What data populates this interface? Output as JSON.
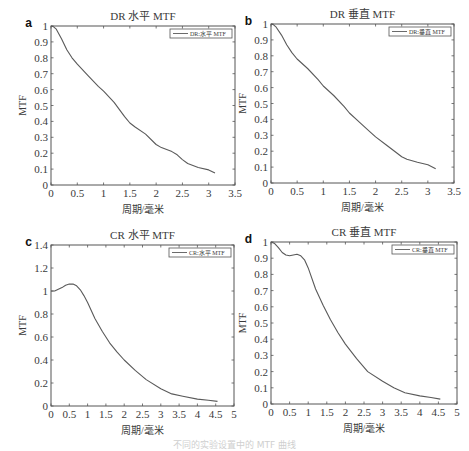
{
  "figure": {
    "axis_color": "#555555",
    "line_color": "#5a5a5a",
    "text_color": "#3a3a3a",
    "caption": "不同的实验设置中的 MTF 曲线"
  },
  "chart_data": [
    {
      "panel": "a",
      "type": "line",
      "title": "DR 水平 MTF",
      "xlabel": "周期/毫米",
      "ylabel": "MTF",
      "legend": "DR:水平 MTF",
      "legend_position": "top-right",
      "grid": false,
      "xlim": [
        0,
        3.5
      ],
      "ylim": [
        0,
        1
      ],
      "xticks": [
        0,
        0.5,
        1,
        1.5,
        2,
        2.5,
        3,
        3.5
      ],
      "xtick_labels": [
        "0",
        "0.5",
        "1",
        "1.5",
        "2",
        "2.5",
        "3",
        "3.5"
      ],
      "yticks": [
        0,
        0.1,
        0.2,
        0.3,
        0.4,
        0.5,
        0.6,
        0.7,
        0.8,
        0.9,
        1
      ],
      "ytick_labels": [
        "0",
        "0.1",
        "0.2",
        "0.3",
        "0.4",
        "0.5",
        "0.6",
        "0.7",
        "0.8",
        "0.9",
        "1"
      ],
      "box": {
        "x": 51,
        "y": 26,
        "w": 184,
        "h": 159
      },
      "series": [
        {
          "name": "DR:水平 MTF",
          "x": [
            0,
            0.05,
            0.1,
            0.2,
            0.3,
            0.4,
            0.5,
            0.7,
            0.9,
            1.0,
            1.2,
            1.4,
            1.5,
            1.6,
            1.8,
            2.0,
            2.1,
            2.3,
            2.4,
            2.5,
            2.6,
            2.8,
            3.0,
            3.12
          ],
          "y": [
            1.0,
            0.995,
            0.98,
            0.92,
            0.85,
            0.8,
            0.76,
            0.69,
            0.62,
            0.59,
            0.52,
            0.43,
            0.39,
            0.365,
            0.32,
            0.255,
            0.235,
            0.21,
            0.19,
            0.16,
            0.135,
            0.11,
            0.095,
            0.075
          ]
        }
      ]
    },
    {
      "panel": "b",
      "type": "line",
      "title": "DR 垂直 MTF",
      "xlabel": "周期/毫米",
      "ylabel": "MTF",
      "legend": "DR:垂直 MTF",
      "legend_position": "top-right",
      "grid": false,
      "xlim": [
        0,
        3.5
      ],
      "ylim": [
        0,
        1
      ],
      "xticks": [
        0,
        0.5,
        1,
        1.5,
        2,
        2.5,
        3,
        3.5
      ],
      "xtick_labels": [
        "0",
        "0.5",
        "1",
        "1.5",
        "2",
        "2.5",
        "3",
        "3.5"
      ],
      "yticks": [
        0,
        0.1,
        0.2,
        0.3,
        0.4,
        0.5,
        0.6,
        0.7,
        0.8,
        0.9,
        1
      ],
      "ytick_labels": [
        "0",
        "0.1",
        "0.2",
        "0.3",
        "0.4",
        "0.5",
        "0.6",
        "0.7",
        "0.8",
        "0.9",
        "1"
      ],
      "box": {
        "x": 271,
        "y": 24,
        "w": 183,
        "h": 159
      },
      "series": [
        {
          "name": "DR:垂直 MTF",
          "x": [
            0,
            0.05,
            0.1,
            0.2,
            0.3,
            0.4,
            0.5,
            0.7,
            0.9,
            1.0,
            1.2,
            1.4,
            1.5,
            1.7,
            1.9,
            2.0,
            2.2,
            2.4,
            2.5,
            2.6,
            2.8,
            3.0,
            3.15
          ],
          "y": [
            1.0,
            0.995,
            0.98,
            0.93,
            0.87,
            0.82,
            0.78,
            0.72,
            0.65,
            0.61,
            0.55,
            0.48,
            0.44,
            0.38,
            0.32,
            0.29,
            0.24,
            0.19,
            0.165,
            0.15,
            0.13,
            0.115,
            0.09
          ]
        }
      ]
    },
    {
      "panel": "c",
      "type": "line",
      "title": "CR 水平 MTF",
      "xlabel": "周期/毫米",
      "ylabel": "MTF",
      "legend": "CR:水平 MTF",
      "legend_position": "top-right",
      "grid": false,
      "xlim": [
        0,
        5
      ],
      "ylim": [
        0,
        1.4
      ],
      "xticks": [
        0,
        0.5,
        1,
        1.5,
        2,
        2.5,
        3,
        3.5,
        4,
        4.5,
        5
      ],
      "xtick_labels": [
        "0",
        "0.5",
        "1",
        "1.5",
        "2",
        "2.5",
        "3",
        "3.5",
        "4",
        "4.5",
        "5"
      ],
      "yticks": [
        0,
        0.2,
        0.4,
        0.6,
        0.8,
        1.0,
        1.2,
        1.4
      ],
      "ytick_labels": [
        "0",
        "0.2",
        "0.4",
        "0.6",
        "0.8",
        "1",
        "1.2",
        "1.4"
      ],
      "box": {
        "x": 51,
        "y": 245,
        "w": 183,
        "h": 161
      },
      "series": [
        {
          "name": "CR:水平 MTF",
          "x": [
            0,
            0.1,
            0.2,
            0.3,
            0.4,
            0.5,
            0.6,
            0.7,
            0.8,
            0.9,
            1.0,
            1.2,
            1.4,
            1.6,
            1.8,
            2.0,
            2.3,
            2.6,
            3.0,
            3.3,
            3.6,
            4.0,
            4.3,
            4.55
          ],
          "y": [
            1.0,
            1.0,
            1.015,
            1.03,
            1.05,
            1.06,
            1.06,
            1.045,
            1.01,
            0.96,
            0.9,
            0.76,
            0.65,
            0.55,
            0.47,
            0.4,
            0.31,
            0.23,
            0.15,
            0.105,
            0.085,
            0.06,
            0.05,
            0.04
          ]
        }
      ]
    },
    {
      "panel": "d",
      "type": "line",
      "title": "CR 垂直 MTF",
      "xlabel": "周期/毫米",
      "ylabel": "MTF",
      "legend": "CR:垂直 MTF",
      "legend_position": "top-right",
      "grid": false,
      "xlim": [
        0,
        5
      ],
      "ylim": [
        0,
        1
      ],
      "xticks": [
        0,
        0.5,
        1,
        1.5,
        2,
        2.5,
        3,
        3.5,
        4,
        4.5,
        5
      ],
      "xtick_labels": [
        "0",
        "0.5",
        "1",
        "1.5",
        "2",
        "2.5",
        "3",
        "3.5",
        "4",
        "4.5",
        "5"
      ],
      "yticks": [
        0,
        0.1,
        0.2,
        0.3,
        0.4,
        0.5,
        0.6,
        0.7,
        0.8,
        0.9,
        1
      ],
      "ytick_labels": [
        "0",
        "0.1",
        "0.2",
        "0.3",
        "0.4",
        "0.5",
        "0.6",
        "0.7",
        "0.8",
        "0.9",
        "1"
      ],
      "box": {
        "x": 271,
        "y": 242,
        "w": 186,
        "h": 162
      },
      "series": [
        {
          "name": "CR:垂直 MTF",
          "x": [
            0,
            0.1,
            0.2,
            0.3,
            0.4,
            0.5,
            0.6,
            0.7,
            0.8,
            0.9,
            1.0,
            1.2,
            1.4,
            1.6,
            1.8,
            2.0,
            2.3,
            2.6,
            3.0,
            3.3,
            3.6,
            4.0,
            4.3,
            4.55
          ],
          "y": [
            1.0,
            0.99,
            0.965,
            0.935,
            0.92,
            0.915,
            0.92,
            0.925,
            0.915,
            0.89,
            0.84,
            0.71,
            0.61,
            0.52,
            0.44,
            0.37,
            0.28,
            0.2,
            0.14,
            0.1,
            0.07,
            0.05,
            0.04,
            0.03
          ]
        }
      ]
    }
  ]
}
